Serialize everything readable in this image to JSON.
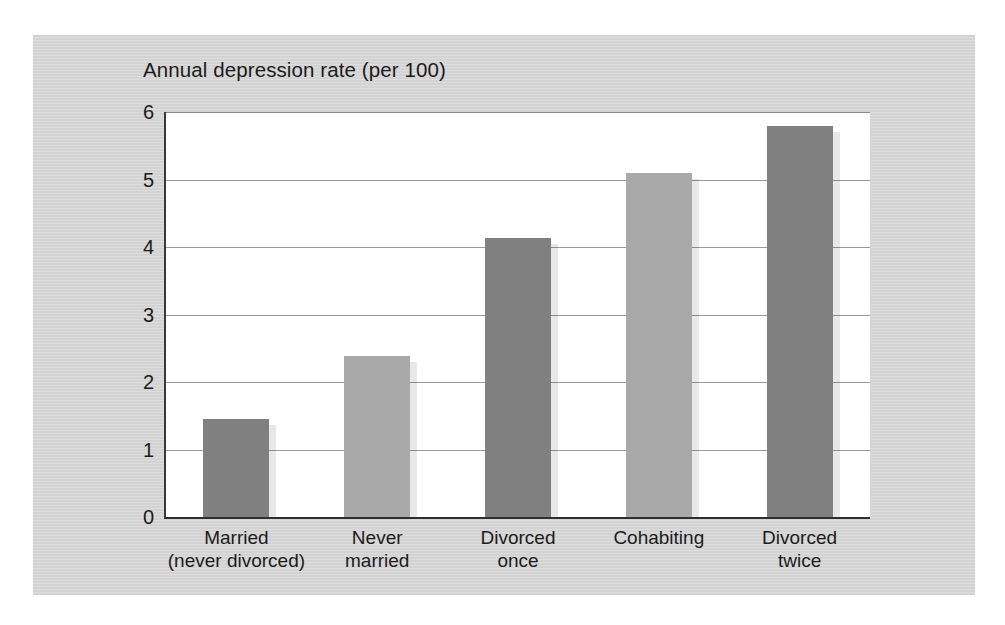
{
  "page": {
    "body_text_sliver": "a narrow line of body text clipped at the top edge of the scanned page"
  },
  "figure": {
    "title": "Annual depression rate (per 100)"
  },
  "chart_data": {
    "type": "bar",
    "title": "Annual depression rate (per 100)",
    "xlabel": "",
    "ylabel": "Annual depression rate (per 100)",
    "ylim": [
      0,
      6
    ],
    "yticks": [
      0,
      1,
      2,
      3,
      4,
      5,
      6
    ],
    "ytick_labels": [
      "0",
      "1",
      "2",
      "3",
      "4",
      "5",
      "6"
    ],
    "grid": true,
    "legend": "none",
    "categories": [
      "Married (never divorced)",
      "Never married",
      "Divorced once",
      "Cohabiting",
      "Divorced twice"
    ],
    "category_lines": [
      [
        "Married",
        "(never divorced)"
      ],
      [
        "Never",
        "married"
      ],
      [
        "Divorced",
        "once"
      ],
      [
        "Cohabiting",
        ""
      ],
      [
        "Divorced",
        "twice"
      ]
    ],
    "values": [
      1.45,
      2.38,
      4.13,
      5.1,
      5.8
    ],
    "bar_colors": [
      "#808080",
      "#a9a9a9",
      "#808080",
      "#a9a9a9",
      "#808080"
    ],
    "colors": {
      "panel_background": "#d6d6d6",
      "plot_background": "#ffffff",
      "gridline": "#9a9a9a",
      "axis": "#2e2e2e",
      "bar_dark": "#808080",
      "bar_light": "#a9a9a9",
      "text": "#1b1b1b"
    }
  }
}
